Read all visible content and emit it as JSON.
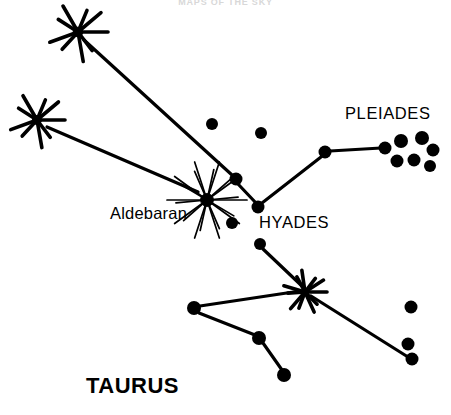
{
  "figure": {
    "title_partial": "MAPS OF THE SKY",
    "constellation": "TAURUS",
    "width": 451,
    "height": 415,
    "background_color": "#ffffff",
    "ink_color": "#000000"
  },
  "labels": {
    "pleiades": "PLEIADES",
    "hyades": "HYADES",
    "aldebaran": "Aldebaran",
    "taurus": "TAURUS"
  },
  "chart_data": {
    "type": "scatter",
    "title": "TAURUS",
    "xlabel": "",
    "ylabel": "",
    "xlim": [
      0,
      451
    ],
    "ylim": [
      0,
      415
    ],
    "grid": false,
    "legend": "none",
    "annotations": [
      {
        "text": "PLEIADES",
        "x": 345,
        "y": 113
      },
      {
        "text": "HYADES",
        "x": 259,
        "y": 222
      },
      {
        "text": "Aldebaran",
        "x": 110,
        "y": 213
      },
      {
        "text": "TAURUS",
        "x": 86,
        "y": 386
      }
    ],
    "series": [
      {
        "name": "bright-stars-burst",
        "marker": "starburst",
        "points": [
          {
            "id": "beta-tauri",
            "x": 78,
            "y": 32,
            "size": 30,
            "rays": 9
          },
          {
            "id": "zeta-upper",
            "x": 37,
            "y": 120,
            "size": 28,
            "rays": 9
          },
          {
            "id": "aldebaran",
            "x": 207,
            "y": 200,
            "size": 40,
            "rays": 20
          },
          {
            "id": "lower-join",
            "x": 305,
            "y": 292,
            "size": 22,
            "rays": 11
          }
        ]
      },
      {
        "name": "hyades-and-field-stars",
        "marker": "dot",
        "points": [
          {
            "id": "h1",
            "x": 212,
            "y": 124,
            "r": 6.0
          },
          {
            "id": "h2",
            "x": 261,
            "y": 133,
            "r": 6.0
          },
          {
            "id": "h3",
            "x": 236,
            "y": 179,
            "r": 6.5
          },
          {
            "id": "h4",
            "x": 258,
            "y": 207,
            "r": 6.5
          },
          {
            "id": "h5",
            "x": 232,
            "y": 223,
            "r": 6.0
          },
          {
            "id": "h6",
            "x": 260,
            "y": 244,
            "r": 6.0
          },
          {
            "id": "h7",
            "x": 325,
            "y": 152,
            "r": 6.5
          }
        ]
      },
      {
        "name": "pleiades-cluster",
        "marker": "dot",
        "points": [
          {
            "id": "p1",
            "x": 385,
            "y": 148,
            "r": 6.5
          },
          {
            "id": "p2",
            "x": 401,
            "y": 141,
            "r": 7.0
          },
          {
            "id": "p3",
            "x": 422,
            "y": 138,
            "r": 7.0
          },
          {
            "id": "p4",
            "x": 433,
            "y": 150,
            "r": 6.5
          },
          {
            "id": "p5",
            "x": 397,
            "y": 161,
            "r": 6.5
          },
          {
            "id": "p6",
            "x": 414,
            "y": 160,
            "r": 6.5
          },
          {
            "id": "p7",
            "x": 430,
            "y": 166,
            "r": 6.0
          }
        ]
      },
      {
        "name": "southern-horn-stars",
        "marker": "dot",
        "points": [
          {
            "id": "s1",
            "x": 194,
            "y": 308,
            "r": 7.0
          },
          {
            "id": "s2",
            "x": 259,
            "y": 338,
            "r": 7.0
          },
          {
            "id": "s3",
            "x": 284,
            "y": 375,
            "r": 7.0
          },
          {
            "id": "s4",
            "x": 411,
            "y": 307,
            "r": 6.5
          },
          {
            "id": "s5",
            "x": 408,
            "y": 344,
            "r": 6.5
          },
          {
            "id": "s6",
            "x": 412,
            "y": 359,
            "r": 6.5
          }
        ]
      }
    ],
    "edges": [
      {
        "from": "beta-tauri",
        "to": "h3",
        "x1": 84,
        "y1": 40,
        "x2": 232,
        "y2": 175
      },
      {
        "from": "zeta-upper",
        "to": "aldebaran",
        "x1": 47,
        "y1": 127,
        "x2": 198,
        "y2": 192
      },
      {
        "from": "h3",
        "to": "h4",
        "x1": 238,
        "y1": 184,
        "x2": 256,
        "y2": 203
      },
      {
        "from": "h4",
        "to": "h7",
        "x1": 262,
        "y1": 203,
        "x2": 321,
        "y2": 157
      },
      {
        "from": "h7",
        "to": "p1",
        "x1": 330,
        "y1": 151,
        "x2": 381,
        "y2": 148
      },
      {
        "from": "h6",
        "to": "lower-join",
        "x1": 263,
        "y1": 249,
        "x2": 303,
        "y2": 287
      },
      {
        "from": "s1",
        "to": "lower-join",
        "x1": 200,
        "y1": 306,
        "x2": 300,
        "y2": 291
      },
      {
        "from": "s1",
        "to": "s2",
        "x1": 199,
        "y1": 313,
        "x2": 255,
        "y2": 335
      },
      {
        "from": "s2",
        "to": "s3",
        "x1": 263,
        "y1": 343,
        "x2": 282,
        "y2": 370
      },
      {
        "from": "lower-join",
        "to": "s6",
        "x1": 311,
        "y1": 296,
        "x2": 408,
        "y2": 357
      }
    ]
  }
}
